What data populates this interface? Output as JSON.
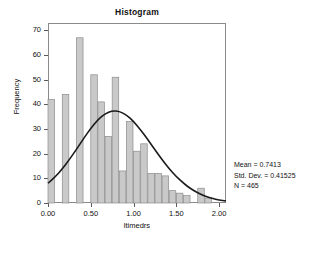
{
  "chart_data": {
    "type": "bar",
    "title": "Histogram",
    "xlabel": "ltimedrs",
    "ylabel": "Frequency",
    "xlim": [
      0.0,
      2.08
    ],
    "ylim": [
      0,
      73
    ],
    "xticks": [
      "0.00",
      "0.50",
      "1.00",
      "1.50",
      "2.00"
    ],
    "xtick_values": [
      0.0,
      0.5,
      1.0,
      1.5,
      2.0
    ],
    "yticks": [
      "0",
      "10",
      "20",
      "30",
      "40",
      "50",
      "60",
      "70"
    ],
    "ytick_values": [
      0,
      10,
      20,
      30,
      40,
      50,
      60,
      70
    ],
    "grid": false,
    "bin_width": 0.0833,
    "bin_starts": [
      0.0,
      0.0833,
      0.1667,
      0.25,
      0.3333,
      0.4167,
      0.5,
      0.5833,
      0.6667,
      0.75,
      0.8333,
      0.9167,
      1.0,
      1.0833,
      1.1667,
      1.25,
      1.3333,
      1.4167,
      1.5,
      1.5833,
      1.6667,
      1.75,
      1.8333,
      1.9167
    ],
    "values": [
      42,
      0,
      44,
      0,
      67,
      0,
      52,
      41,
      27,
      51,
      13,
      33,
      21,
      24,
      12,
      12,
      11,
      5,
      4,
      3,
      0,
      6,
      2,
      0
    ],
    "bar_fill": "#c9c9c9",
    "bar_stroke": "#8c8c8c",
    "curve_color": "#1a1a1a",
    "curve_label": "normal",
    "curve_points": [
      [
        0.0,
        8.0
      ],
      [
        0.0833,
        10.6
      ],
      [
        0.1667,
        13.8
      ],
      [
        0.25,
        17.6
      ],
      [
        0.3333,
        21.8
      ],
      [
        0.4167,
        26.2
      ],
      [
        0.5,
        30.3
      ],
      [
        0.5833,
        33.8
      ],
      [
        0.6667,
        36.2
      ],
      [
        0.75,
        37.4
      ],
      [
        0.8333,
        37.2
      ],
      [
        0.9167,
        35.7
      ],
      [
        1.0,
        33.1
      ],
      [
        1.0833,
        29.6
      ],
      [
        1.1667,
        25.7
      ],
      [
        1.25,
        21.6
      ],
      [
        1.3333,
        17.6
      ],
      [
        1.4167,
        13.9
      ],
      [
        1.5,
        10.7
      ],
      [
        1.5833,
        8.0
      ],
      [
        1.6667,
        5.8
      ],
      [
        1.75,
        4.1
      ],
      [
        1.8333,
        2.8
      ],
      [
        1.9167,
        1.9
      ],
      [
        2.0,
        1.2
      ],
      [
        2.08,
        0.8
      ]
    ]
  },
  "stats": {
    "mean_line": "Mean = 0.7413",
    "std_dev_line": "Std. Dev. = 0.41525",
    "n_line": "N = 465"
  }
}
